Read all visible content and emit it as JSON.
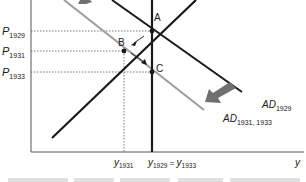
{
  "diagram": {
    "y_axis_labels": [
      {
        "main": "P",
        "sub": "1929",
        "y": 31
      },
      {
        "main": "P",
        "sub": "1931",
        "y": 51
      },
      {
        "main": "P",
        "sub": "1933",
        "y": 72
      }
    ],
    "x_axis_labels": [
      {
        "main": "y",
        "sub": "1931"
      },
      {
        "text": "y1929 = y1933",
        "main1": "y",
        "sub1": "1929",
        "eq": " = ",
        "main2": "y",
        "sub2": "1933"
      }
    ],
    "x_axis_title": "y",
    "points": [
      {
        "label": "A",
        "x": 152,
        "y": 31
      },
      {
        "label": "B",
        "x": 124,
        "y": 51
      },
      {
        "label": "C",
        "x": 152,
        "y": 72
      }
    ],
    "curves": [
      {
        "name": "AS",
        "label": "",
        "color": "#1a1a1a"
      },
      {
        "name": "AD1929",
        "label_main": "AD",
        "label_sub": "1929",
        "color": "#1a1a1a"
      },
      {
        "name": "AD1931_1933",
        "label_main": "AD",
        "label_sub": "1931, 1933",
        "color": "#a0a0a0"
      },
      {
        "name": "LRAS",
        "label": "",
        "color": "#1a1a1a"
      }
    ],
    "colors": {
      "dark_line": "#1a1a1a",
      "gray_line": "#a0a0a0",
      "shift_arrow": "#707070",
      "axis": "#444444",
      "dotted": "#555555"
    },
    "caption_fragment": ""
  }
}
